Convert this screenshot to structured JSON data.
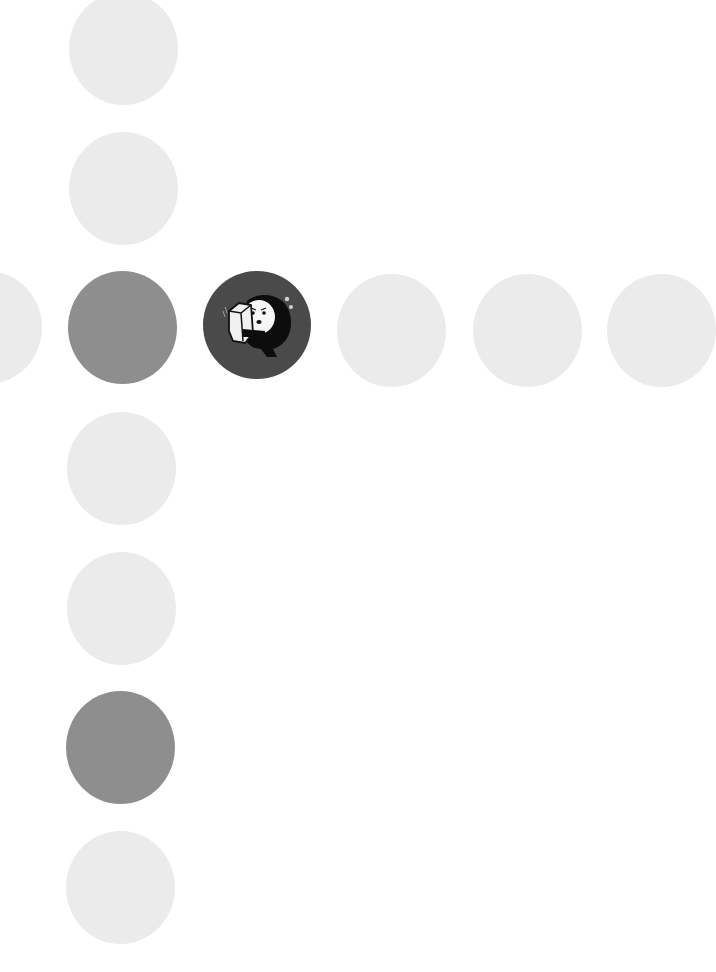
{
  "grid": {
    "colors": {
      "light": "#ebebeb",
      "mid": "#8e8e8e",
      "dark": "#4a4a4a"
    },
    "items": [
      {
        "id": "col-0",
        "tone": "light",
        "x": 69,
        "y": -8
      },
      {
        "id": "col-1",
        "tone": "light",
        "x": 69,
        "y": 132
      },
      {
        "id": "row-left-partial",
        "tone": "light",
        "x": -67,
        "y": 271
      },
      {
        "id": "row-center-gray",
        "tone": "mid",
        "x": 68,
        "y": 271
      },
      {
        "id": "row-selected-character",
        "tone": "dark",
        "x": 203,
        "y": 271,
        "icon": "character-hugging-box-icon"
      },
      {
        "id": "row-3",
        "tone": "light",
        "x": 337,
        "y": 274
      },
      {
        "id": "row-4",
        "tone": "light",
        "x": 473,
        "y": 274
      },
      {
        "id": "row-right-partial",
        "tone": "light",
        "x": 607,
        "y": 274
      },
      {
        "id": "col-3",
        "tone": "light",
        "x": 67,
        "y": 412
      },
      {
        "id": "col-4",
        "tone": "light",
        "x": 67,
        "y": 552
      },
      {
        "id": "col-5",
        "tone": "mid",
        "x": 66,
        "y": 691
      },
      {
        "id": "col-6",
        "tone": "light",
        "x": 66,
        "y": 831
      }
    ]
  }
}
